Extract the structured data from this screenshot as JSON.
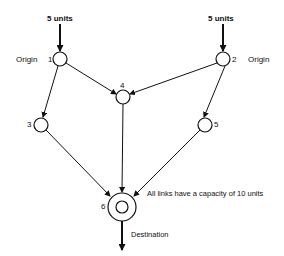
{
  "diagram": {
    "supply_label_left": "5 units",
    "supply_label_right": "5 units",
    "origin_label_left": "Origin",
    "origin_label_right": "Origin",
    "destination_label": "Destination",
    "capacity_note": "All links have a capacity of 10 units",
    "nodes": [
      {
        "id": "1",
        "label": "1",
        "role": "origin"
      },
      {
        "id": "2",
        "label": "2",
        "role": "origin"
      },
      {
        "id": "3",
        "label": "3",
        "role": "intermediate"
      },
      {
        "id": "4",
        "label": "4",
        "role": "intermediate"
      },
      {
        "id": "5",
        "label": "5",
        "role": "intermediate"
      },
      {
        "id": "6",
        "label": "6",
        "role": "destination"
      }
    ],
    "links": [
      {
        "from": "1",
        "to": "3"
      },
      {
        "from": "1",
        "to": "4"
      },
      {
        "from": "2",
        "to": "4"
      },
      {
        "from": "2",
        "to": "5"
      },
      {
        "from": "3",
        "to": "6"
      },
      {
        "from": "4",
        "to": "6"
      },
      {
        "from": "5",
        "to": "6"
      }
    ]
  }
}
